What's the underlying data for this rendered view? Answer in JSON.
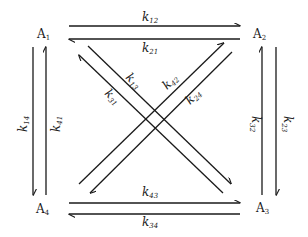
{
  "diagram": {
    "type": "kinetic-scheme",
    "nodes": [
      {
        "id": "A1",
        "base": "A",
        "sub": "1",
        "x": 38,
        "y": 37
      },
      {
        "id": "A2",
        "base": "A",
        "sub": "2",
        "x": 253,
        "y": 37
      },
      {
        "id": "A3",
        "base": "A",
        "sub": "3",
        "x": 256,
        "y": 211
      },
      {
        "id": "A4",
        "base": "A",
        "sub": "4",
        "x": 37,
        "y": 212
      }
    ],
    "edges": [
      {
        "from": "A1",
        "to": "A2",
        "label_base": "k",
        "label_sub": "12"
      },
      {
        "from": "A2",
        "to": "A1",
        "label_base": "k",
        "label_sub": "21"
      },
      {
        "from": "A1",
        "to": "A3",
        "label_base": "k",
        "label_sub": "13"
      },
      {
        "from": "A3",
        "to": "A1",
        "label_base": "k",
        "label_sub": "31"
      },
      {
        "from": "A4",
        "to": "A2",
        "label_base": "k",
        "label_sub": "42"
      },
      {
        "from": "A2",
        "to": "A4",
        "label_base": "k",
        "label_sub": "24"
      },
      {
        "from": "A1",
        "to": "A4",
        "label_base": "k",
        "label_sub": "14"
      },
      {
        "from": "A4",
        "to": "A1",
        "label_base": "k",
        "label_sub": "41"
      },
      {
        "from": "A3",
        "to": "A2",
        "label_base": "k",
        "label_sub": "32"
      },
      {
        "from": "A2",
        "to": "A3",
        "label_base": "k",
        "label_sub": "23"
      },
      {
        "from": "A4",
        "to": "A3",
        "label_base": "k",
        "label_sub": "43"
      },
      {
        "from": "A3",
        "to": "A4",
        "label_base": "k",
        "label_sub": "34"
      }
    ]
  },
  "labels": {
    "A": "A",
    "k": "k",
    "n1": "1",
    "n2": "2",
    "n3": "3",
    "n4": "4",
    "k12": "12",
    "k21": "21",
    "k13": "13",
    "k31": "31",
    "k42": "42",
    "k24": "24",
    "k14": "14",
    "k41": "41",
    "k32": "32",
    "k23": "23",
    "k43": "43",
    "k34": "34"
  },
  "colors": {
    "ink": "#1a1a1a",
    "background": "#ffffff"
  }
}
